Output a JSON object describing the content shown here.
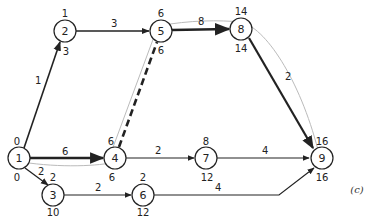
{
  "diagram": {
    "type": "activity-network",
    "caption": "(c)",
    "nodes": [
      {
        "id": "1",
        "label": "1",
        "x": 19,
        "y": 158,
        "early": "0",
        "late": "0"
      },
      {
        "id": "2",
        "label": "2",
        "x": 65,
        "y": 31,
        "early": "1",
        "late": "3"
      },
      {
        "id": "3",
        "label": "3",
        "x": 53,
        "y": 195,
        "early": "2",
        "late": "10"
      },
      {
        "id": "4",
        "label": "4",
        "x": 115,
        "y": 158,
        "early": "6",
        "late": "6"
      },
      {
        "id": "5",
        "label": "5",
        "x": 161,
        "y": 31,
        "early": "6",
        "late": "6"
      },
      {
        "id": "6",
        "label": "6",
        "x": 143,
        "y": 195,
        "early": "2",
        "late": "12"
      },
      {
        "id": "7",
        "label": "7",
        "x": 206,
        "y": 158,
        "early": "8",
        "late": "12"
      },
      {
        "id": "8",
        "label": "8",
        "x": 241,
        "y": 29,
        "early": "14",
        "late": "14"
      },
      {
        "id": "9",
        "label": "9",
        "x": 321,
        "y": 158,
        "early": "16",
        "late": "16"
      }
    ],
    "edges": [
      {
        "from": "1",
        "to": "2",
        "duration": "1",
        "style": "normal"
      },
      {
        "from": "1",
        "to": "4",
        "duration": "6",
        "style": "critical"
      },
      {
        "from": "1",
        "to": "3",
        "duration": "2",
        "style": "normal"
      },
      {
        "from": "2",
        "to": "5",
        "duration": "3",
        "style": "normal"
      },
      {
        "from": "4",
        "to": "5",
        "duration": "",
        "style": "dummy-critical"
      },
      {
        "from": "4",
        "to": "7",
        "duration": "2",
        "style": "normal"
      },
      {
        "from": "5",
        "to": "8",
        "duration": "8",
        "style": "critical"
      },
      {
        "from": "8",
        "to": "9",
        "duration": "2",
        "style": "critical"
      },
      {
        "from": "7",
        "to": "9",
        "duration": "4",
        "style": "normal"
      },
      {
        "from": "3",
        "to": "6",
        "duration": "2",
        "style": "normal"
      },
      {
        "from": "6",
        "to": "9",
        "duration": "4",
        "style": "normal"
      }
    ]
  }
}
